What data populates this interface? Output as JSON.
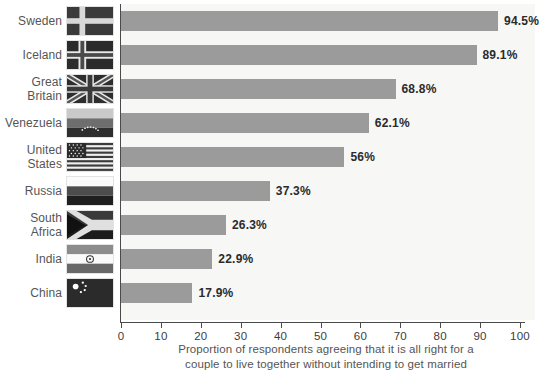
{
  "chart_data": {
    "type": "bar",
    "orientation": "horizontal",
    "title": "",
    "xlabel": "Proportion of respondents agreeing that it is all right for a couple to live together without intending to get married",
    "ylabel": "",
    "xlim": [
      0,
      100
    ],
    "grid": false,
    "legend": null,
    "bar_color": "#9b9b9b",
    "plot_background": "#f7f7f6",
    "axis_color": "#4a4a4a",
    "tick_labels": [
      "0",
      "10",
      "20",
      "30",
      "40",
      "50",
      "60",
      "70",
      "80",
      "90",
      "100"
    ],
    "tick_values": [
      0,
      10,
      20,
      30,
      40,
      50,
      60,
      70,
      80,
      90,
      100
    ],
    "categories": [
      "Sweden",
      "Iceland",
      "Great Britain",
      "Venezuela",
      "United States",
      "Russia",
      "South Africa",
      "India",
      "China"
    ],
    "values": [
      94.5,
      89.1,
      68.8,
      62.1,
      56,
      37.3,
      26.3,
      22.9,
      17.9
    ],
    "value_labels": [
      "94.5%",
      "89.1%",
      "68.8%",
      "62.1%",
      "56%",
      "37.3%",
      "26.3%",
      "22.9%",
      "17.9%"
    ],
    "rows": [
      {
        "country": "Sweden",
        "value": 94.5,
        "label": "94.5%",
        "flag": "flag-sweden"
      },
      {
        "country": "Iceland",
        "value": 89.1,
        "label": "89.1%",
        "flag": "flag-iceland"
      },
      {
        "country": "Great Britain",
        "value": 68.8,
        "label": "68.8%",
        "flag": "flag-great-britain"
      },
      {
        "country": "Venezuela",
        "value": 62.1,
        "label": "62.1%",
        "flag": "flag-venezuela"
      },
      {
        "country": "United States",
        "value": 56,
        "label": "56%",
        "flag": "flag-united-states"
      },
      {
        "country": "Russia",
        "value": 37.3,
        "label": "37.3%",
        "flag": "flag-russia"
      },
      {
        "country": "South Africa",
        "value": 26.3,
        "label": "26.3%",
        "flag": "flag-south-africa"
      },
      {
        "country": "India",
        "value": 22.9,
        "label": "22.9%",
        "flag": "flag-india"
      },
      {
        "country": "China",
        "value": 17.9,
        "label": "17.9%",
        "flag": "flag-china"
      }
    ],
    "caption_line_1": "Proportion of respondents agreeing that it is all right for a",
    "caption_line_2": "couple to live together without intending to get married"
  }
}
